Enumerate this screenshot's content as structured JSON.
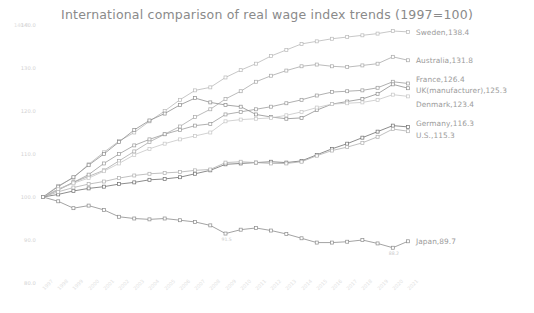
{
  "chart_data": {
    "type": "line",
    "title": "International comparison of real wage index trends (1997=100)",
    "xlabel": "",
    "ylabel": "",
    "unit_label": "140.0",
    "ylim": [
      80.0,
      140.0
    ],
    "yticks": [
      "140.0",
      "130.0",
      "120.0",
      "110.0",
      "100.0",
      "90.0",
      "80.0"
    ],
    "ytick_values": [
      140.0,
      130.0,
      120.0,
      110.0,
      100.0,
      90.0,
      80.0
    ],
    "grid": false,
    "legend": "inline-right-end-labels",
    "x": [
      1997,
      1998,
      1999,
      2000,
      2001,
      2002,
      2003,
      2004,
      2005,
      2006,
      2007,
      2008,
      2009,
      2010,
      2011,
      2012,
      2013,
      2014,
      2015,
      2016,
      2017,
      2018,
      2019,
      2020,
      2021
    ],
    "categories": [
      "1997",
      "1998",
      "1999",
      "2000",
      "2001",
      "2002",
      "2003",
      "2004",
      "2005",
      "2006",
      "2007",
      "2008",
      "2009",
      "2010",
      "2011",
      "2012",
      "2013",
      "2014",
      "2015",
      "2016",
      "2017",
      "2018",
      "2019",
      "2020",
      "2021"
    ],
    "series": [
      {
        "name": "Sweden",
        "end_label": "Sweden,138.4",
        "end_value": 138.4,
        "color": "#b9b9b9",
        "values": [
          100.0,
          102.6,
          104.5,
          107.6,
          110.4,
          113.0,
          115.0,
          117.6,
          120.0,
          122.6,
          124.8,
          125.5,
          127.8,
          129.5,
          131.0,
          132.8,
          134.2,
          135.6,
          136.2,
          136.8,
          137.2,
          137.6,
          138.0,
          138.6,
          138.4
        ]
      },
      {
        "name": "Australia",
        "end_label": "Australia,131.8",
        "end_value": 131.8,
        "color": "#a9a9a9",
        "values": [
          100.0,
          101.8,
          103.4,
          104.8,
          106.2,
          108.4,
          110.6,
          112.8,
          114.6,
          116.4,
          118.6,
          120.4,
          122.8,
          124.6,
          126.8,
          128.2,
          129.4,
          130.4,
          130.8,
          130.4,
          130.2,
          130.6,
          131.0,
          132.6,
          131.8
        ]
      },
      {
        "name": "France",
        "end_label": "France,126.4",
        "end_value": 126.4,
        "color": "#9c9c9c",
        "values": [
          100.0,
          101.6,
          103.4,
          105.2,
          107.8,
          110.0,
          112.0,
          113.4,
          114.6,
          115.6,
          116.6,
          117.0,
          119.2,
          119.8,
          120.4,
          121.0,
          121.8,
          122.6,
          123.6,
          124.4,
          124.6,
          124.8,
          125.4,
          126.8,
          126.4
        ]
      },
      {
        "name": "UK(manufacturer)",
        "end_label": "UK(manufacturer),125.3",
        "end_value": 125.3,
        "color": "#8f8f8f",
        "values": [
          100.0,
          102.4,
          104.6,
          107.4,
          110.0,
          112.8,
          115.6,
          117.8,
          119.4,
          121.4,
          123.0,
          122.0,
          121.4,
          121.0,
          119.2,
          118.6,
          118.2,
          118.4,
          120.2,
          121.6,
          122.2,
          122.8,
          124.0,
          126.2,
          125.3
        ]
      },
      {
        "name": "Denmark",
        "end_label": "Denmark,123.4",
        "end_value": 123.4,
        "color": "#c6c6c6",
        "values": [
          100.0,
          101.8,
          103.2,
          104.4,
          106.0,
          107.8,
          109.8,
          111.2,
          112.4,
          113.4,
          114.2,
          115.0,
          117.6,
          118.0,
          118.2,
          118.4,
          119.0,
          119.8,
          120.8,
          121.6,
          121.8,
          122.0,
          122.6,
          123.8,
          123.4
        ]
      },
      {
        "name": "Germany",
        "end_label": "Germany,116.3",
        "end_value": 116.3,
        "color": "#6f6f6f",
        "values": [
          100.0,
          100.6,
          101.4,
          102.0,
          102.4,
          103.0,
          103.4,
          104.0,
          104.2,
          104.6,
          105.4,
          106.2,
          107.6,
          107.8,
          108.0,
          108.2,
          108.0,
          108.4,
          109.8,
          111.2,
          112.4,
          113.8,
          115.2,
          116.6,
          116.3
        ]
      },
      {
        "name": "U.S.",
        "end_label": "U.S.,115.3",
        "end_value": 115.3,
        "color": "#b0b0b0",
        "values": [
          100.0,
          101.2,
          102.2,
          103.0,
          103.6,
          104.4,
          105.0,
          105.4,
          105.6,
          105.8,
          106.2,
          106.4,
          108.0,
          108.2,
          108.0,
          107.8,
          107.8,
          108.2,
          109.6,
          110.8,
          111.6,
          112.6,
          114.0,
          115.8,
          115.3
        ]
      },
      {
        "name": "Japan",
        "end_label": "Japan,89.7",
        "end_value": 89.7,
        "color": "#8c8c8c",
        "values": [
          100.0,
          99.0,
          97.4,
          98.0,
          97.0,
          95.4,
          95.0,
          94.8,
          95.0,
          94.6,
          94.2,
          93.4,
          91.5,
          92.4,
          92.8,
          92.2,
          91.4,
          90.4,
          89.4,
          89.4,
          89.6,
          90.0,
          89.2,
          88.2,
          89.7
        ]
      }
    ],
    "point_labels": [
      {
        "series": "Japan",
        "year": 2009,
        "text": "91.5",
        "value": 91.5
      },
      {
        "series": "Japan",
        "year": 2020,
        "text": "88.2",
        "value": 88.2
      }
    ]
  }
}
